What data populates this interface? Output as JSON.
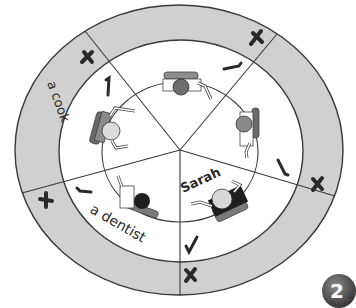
{
  "diagram": {
    "outer_ring": {
      "cx": 179,
      "cy": 150,
      "rx": 164,
      "ry": 145,
      "fill": "#d0d0d0",
      "stroke": "#3a3a3a"
    },
    "inner_area": {
      "cx": 181,
      "cy": 151,
      "rx": 122,
      "ry": 111,
      "fill": "#ffffff",
      "stroke": "#3a3a3a"
    },
    "table_circle": {
      "cx": 180,
      "cy": 152,
      "rx": 78,
      "ry": 70,
      "stroke": "#3a3a3a"
    },
    "center": {
      "x": 180,
      "y": 150
    },
    "dividers": [
      {
        "x": 85,
        "y": 31
      },
      {
        "x": 277,
        "y": 34
      },
      {
        "x": 335,
        "y": 196
      },
      {
        "x": 180,
        "y": 296
      },
      {
        "x": 22,
        "y": 193
      }
    ],
    "segments": [
      {
        "id": "top",
        "ring_label": "",
        "ring_mark": "cross",
        "inner_mark": "tick"
      },
      {
        "id": "right",
        "ring_label": "",
        "ring_mark": "cross",
        "inner_mark": "tick"
      },
      {
        "id": "bottom-right",
        "ring_label": "",
        "ring_mark": "cross",
        "inner_mark": "tick",
        "name": "Sarah"
      },
      {
        "id": "bottom-left",
        "ring_label": "",
        "ring_mark": "cross",
        "inner_mark": "tick",
        "inner_label": "a dentist"
      },
      {
        "id": "left",
        "ring_label": "a cook",
        "ring_mark": "cross",
        "inner_mark": "tick"
      }
    ],
    "labels": {
      "cook": "a cook",
      "dentist": "a dentist",
      "sarah": "Sarah"
    },
    "marks": {
      "cross": "✗",
      "tick": "✓"
    },
    "figures": [
      {
        "position": "top",
        "head_color": "#6e6e6e",
        "chair_color": "#8c8c8c"
      },
      {
        "position": "right",
        "head_color": "#8a8a8a",
        "chair_color": "#6a6a6a"
      },
      {
        "position": "bottom-right",
        "head_color": "#d8d8d8",
        "body_color": "#1e1e1e",
        "chair_color": "#7a7a7a"
      },
      {
        "position": "bottom-left",
        "head_color": "#1e1e1e",
        "chair_color": "#7a7a7a"
      },
      {
        "position": "left",
        "head_color": "#dcdcdc",
        "body_color": "#8a8a8a",
        "chair_color": "#6a6a6a"
      }
    ]
  },
  "page_number": "2"
}
